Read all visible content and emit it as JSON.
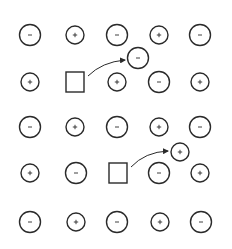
{
  "colors": {
    "stroke": "#2a2a2a",
    "background": "#ffffff"
  },
  "lattice": {
    "rows": [
      {
        "y": 35,
        "cells": [
          {
            "x": 30,
            "type": "anion",
            "symbol": "−"
          },
          {
            "x": 75,
            "type": "cation",
            "symbol": "+"
          },
          {
            "x": 117,
            "type": "anion",
            "symbol": "−"
          },
          {
            "x": 159,
            "type": "cation",
            "symbol": "+"
          },
          {
            "x": 200,
            "type": "anion",
            "symbol": "−"
          }
        ]
      },
      {
        "y": 82,
        "cells": [
          {
            "x": 30,
            "type": "cation",
            "symbol": "+"
          },
          {
            "x": 75,
            "type": "vacancy",
            "symbol": ""
          },
          {
            "x": 117,
            "type": "cation",
            "symbol": "+"
          },
          {
            "x": 159,
            "type": "anion",
            "symbol": "−"
          },
          {
            "x": 200,
            "type": "cation",
            "symbol": "+"
          }
        ]
      },
      {
        "y": 127,
        "cells": [
          {
            "x": 30,
            "type": "anion",
            "symbol": "−"
          },
          {
            "x": 75,
            "type": "cation",
            "symbol": "+"
          },
          {
            "x": 117,
            "type": "anion",
            "symbol": "−"
          },
          {
            "x": 159,
            "type": "cation",
            "symbol": "+"
          },
          {
            "x": 200,
            "type": "anion",
            "symbol": "−"
          }
        ]
      },
      {
        "y": 173,
        "cells": [
          {
            "x": 30,
            "type": "cation",
            "symbol": "+"
          },
          {
            "x": 76,
            "type": "anion",
            "symbol": "−"
          },
          {
            "x": 118,
            "type": "vacancy",
            "symbol": ""
          },
          {
            "x": 159,
            "type": "anion",
            "symbol": "−"
          },
          {
            "x": 200,
            "type": "cation",
            "symbol": "+"
          }
        ]
      },
      {
        "y": 222,
        "cells": [
          {
            "x": 30,
            "type": "anion",
            "symbol": "−"
          },
          {
            "x": 76,
            "type": "cation",
            "symbol": "+"
          },
          {
            "x": 117,
            "type": "anion",
            "symbol": "−"
          },
          {
            "x": 160,
            "type": "cation",
            "symbol": "+"
          },
          {
            "x": 201,
            "type": "anion",
            "symbol": "−"
          }
        ]
      }
    ]
  },
  "displaced_ions": [
    {
      "x": 138,
      "y": 58,
      "type": "anion",
      "symbol": "−"
    },
    {
      "x": 180,
      "y": 152,
      "type": "cation",
      "symbol": "+"
    }
  ],
  "arrows": [
    {
      "from": [
        88,
        76
      ],
      "ctrl": [
        102,
        62
      ],
      "to": [
        125,
        60
      ]
    },
    {
      "from": [
        131,
        167
      ],
      "ctrl": [
        145,
        152
      ],
      "to": [
        168,
        151
      ]
    }
  ],
  "sizes": {
    "anion_radius": 10.5,
    "cation_radius": 9,
    "vacancy_width": 18,
    "vacancy_height": 20
  }
}
